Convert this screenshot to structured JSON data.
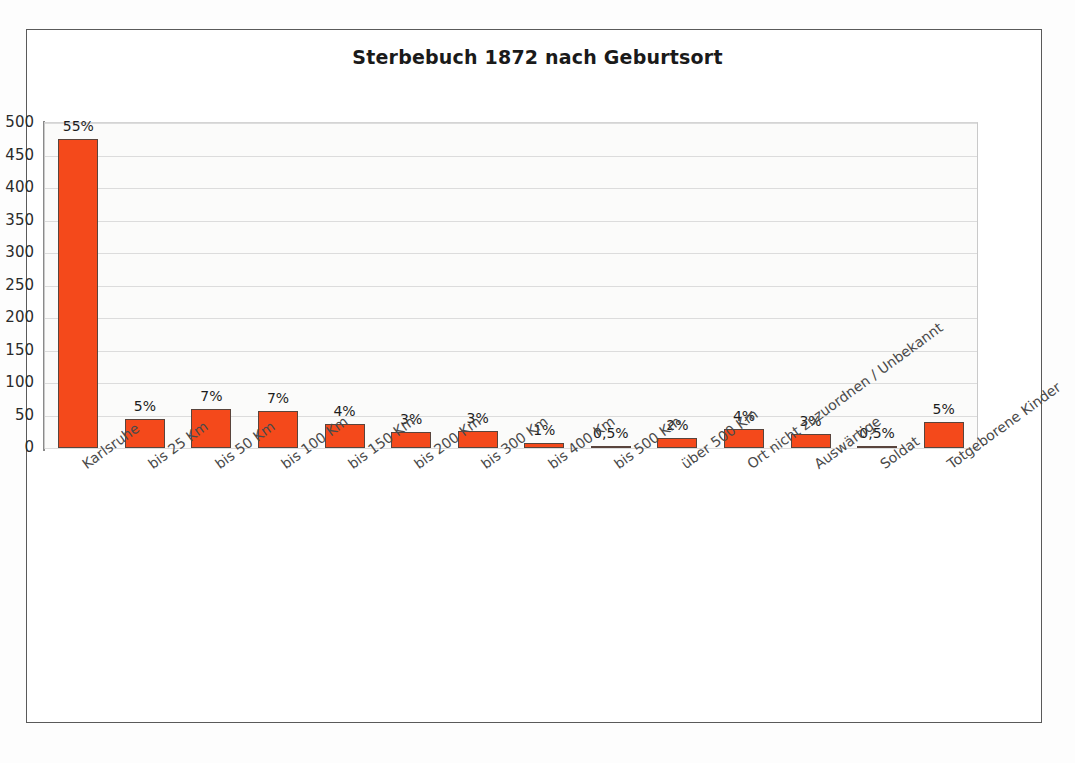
{
  "page": {
    "background_color": "#ffffff",
    "frame_color": "#5a5a5a"
  },
  "chart_data": {
    "type": "bar",
    "title": "Sterbebuch 1872 nach Geburtsort",
    "xlabel": "",
    "ylabel": "",
    "ylim": [
      0,
      500
    ],
    "ytick_step": 50,
    "yticks": [
      "500",
      "450",
      "400",
      "350",
      "300",
      "250",
      "200",
      "150",
      "100",
      "50",
      "0"
    ],
    "grid": true,
    "legend": "none",
    "bar_color": "#f4491b",
    "bar_border_color": "#59443c",
    "categories": [
      "Karlsruhe",
      "bis 25 Km",
      "bis 50 Km",
      "bis 100 Km",
      "bis 150 Km",
      "bis 200 Km",
      "bis 300 Km",
      "bis 400 Km",
      "bis 500 Km",
      "über 500 Km",
      "Ort nicht zuzuordnen / Unbekannt",
      "Auswärtige",
      "Soldat",
      "Totgeborene Kinder"
    ],
    "values": [
      475,
      45,
      60,
      57,
      37,
      24,
      26,
      7,
      2,
      16,
      30,
      22,
      2,
      40
    ],
    "data_labels": [
      "55%",
      "5%",
      "7%",
      "7%",
      "4%",
      "3%",
      "3%",
      "1%",
      "0,5%",
      "2%",
      "4%",
      "3%",
      "0,5%",
      "5%"
    ]
  }
}
